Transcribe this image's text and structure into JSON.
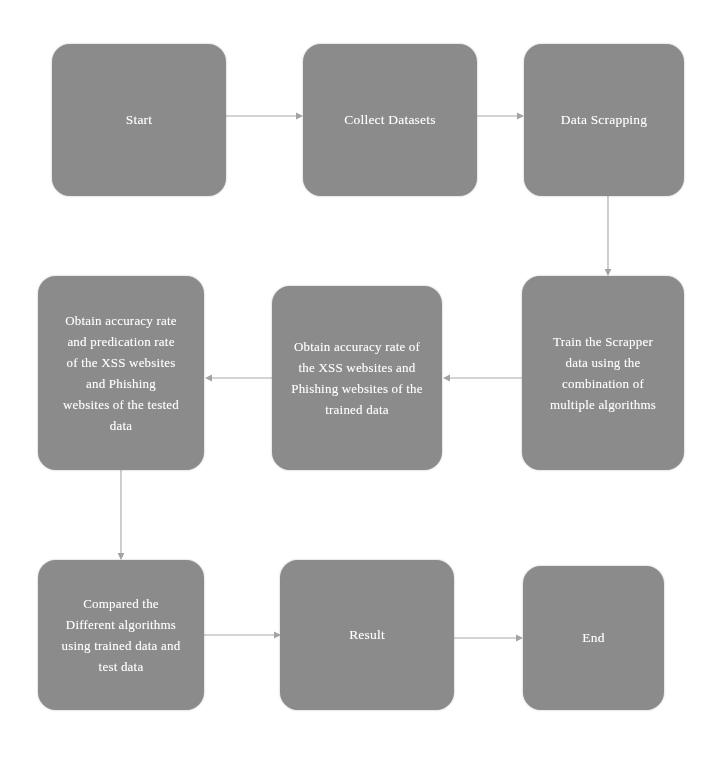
{
  "diagram": {
    "type": "flowchart",
    "background_color": "#ffffff",
    "node_fill_color": "#8b8b8b",
    "node_text_color": "#ffffff",
    "connector_color": "#a9a9a9",
    "nodes": [
      {
        "id": "start",
        "label": "Start",
        "x": 52,
        "y": 44,
        "w": 174,
        "h": 152,
        "lines": [
          "Start"
        ]
      },
      {
        "id": "collect-datasets",
        "label": "Collect Datasets",
        "x": 303,
        "y": 44,
        "w": 174,
        "h": 152,
        "lines": [
          "Collect Datasets"
        ]
      },
      {
        "id": "data-scrapping",
        "label": "Data Scrapping",
        "x": 524,
        "y": 44,
        "w": 160,
        "h": 152,
        "lines": [
          "Data Scrapping"
        ]
      },
      {
        "id": "train-scrapper-data",
        "label": "Train the Scrapper data using the combination of multiple algorithms",
        "x": 522,
        "y": 276,
        "w": 162,
        "h": 194,
        "lines": [
          "Train the Scrapper",
          "data using the",
          "combination of",
          "multiple algorithms"
        ]
      },
      {
        "id": "obtain-accuracy-trained",
        "label": "Obtain accuracy rate of the XSS websites and Phishing websites of the trained data",
        "x": 272,
        "y": 286,
        "w": 170,
        "h": 184,
        "lines": [
          "Obtain accuracy rate of",
          "the XSS websites and",
          "Phishing websites of the",
          "trained data"
        ]
      },
      {
        "id": "obtain-accuracy-tested",
        "label": "Obtain accuracy rate and predication rate of the XSS websites and Phishing websites of the tested data",
        "x": 38,
        "y": 276,
        "w": 166,
        "h": 194,
        "lines": [
          "Obtain accuracy rate",
          "and predication rate",
          "of the XSS websites",
          "and Phishing",
          "websites of the tested",
          "data"
        ]
      },
      {
        "id": "compared-algorithms",
        "label": "Compared the Different algorithms using trained data and test data",
        "x": 38,
        "y": 560,
        "w": 166,
        "h": 150,
        "lines": [
          "Compared the",
          "Different algorithms",
          "using trained data and",
          "test data"
        ]
      },
      {
        "id": "result",
        "label": "Result",
        "x": 280,
        "y": 560,
        "w": 174,
        "h": 150,
        "lines": [
          "Result"
        ]
      },
      {
        "id": "end",
        "label": "End",
        "x": 523,
        "y": 566,
        "w": 141,
        "h": 144,
        "lines": [
          "End"
        ]
      }
    ],
    "connectors": [
      {
        "id": "start-to-collect",
        "from": "start",
        "to": "collect-datasets",
        "direction": "right"
      },
      {
        "id": "collect-to-scrapping",
        "from": "collect-datasets",
        "to": "data-scrapping",
        "direction": "right"
      },
      {
        "id": "scrapping-to-train",
        "from": "data-scrapping",
        "to": "train-scrapper-data",
        "direction": "down"
      },
      {
        "id": "train-to-obtain-trained",
        "from": "train-scrapper-data",
        "to": "obtain-accuracy-trained",
        "direction": "left"
      },
      {
        "id": "obtain-trained-to-obtain-tested",
        "from": "obtain-accuracy-trained",
        "to": "obtain-accuracy-tested",
        "direction": "left"
      },
      {
        "id": "obtain-tested-to-compared",
        "from": "obtain-accuracy-tested",
        "to": "compared-algorithms",
        "direction": "down"
      },
      {
        "id": "compared-to-result",
        "from": "compared-algorithms",
        "to": "result",
        "direction": "right"
      },
      {
        "id": "result-to-end",
        "from": "result",
        "to": "end",
        "direction": "right"
      }
    ]
  },
  "scan_artifact": {
    "visible": true,
    "note": "faint ghosted text bleed-through below the bottom row of boxes"
  }
}
